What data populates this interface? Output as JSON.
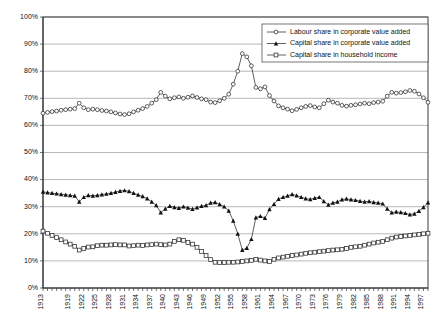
{
  "chart_data": {
    "type": "line",
    "title": "",
    "xlabel": "",
    "ylabel": "",
    "ylim": [
      0,
      100
    ],
    "xlim": [
      1913,
      1998
    ],
    "grid": true,
    "legend_position": "top-right",
    "y_ticks": [
      "0%",
      "10%",
      "20%",
      "30%",
      "40%",
      "50%",
      "60%",
      "70%",
      "80%",
      "90%",
      "100%"
    ],
    "y_tick_values": [
      0,
      10,
      20,
      30,
      40,
      50,
      60,
      70,
      80,
      90,
      100
    ],
    "x_tick_labels": [
      "1913",
      "1919",
      "1922",
      "1925",
      "1928",
      "1931",
      "1934",
      "1937",
      "1940",
      "1943",
      "1946",
      "1949",
      "1952",
      "1955",
      "1958",
      "1961",
      "1964",
      "1967",
      "1970",
      "1973",
      "1976",
      "1979",
      "1982",
      "1985",
      "1988",
      "1991",
      "1994",
      "1997"
    ],
    "x": [
      1913,
      1914,
      1915,
      1916,
      1917,
      1918,
      1919,
      1920,
      1921,
      1922,
      1923,
      1924,
      1925,
      1926,
      1927,
      1928,
      1929,
      1930,
      1931,
      1932,
      1933,
      1934,
      1935,
      1936,
      1937,
      1938,
      1939,
      1940,
      1941,
      1942,
      1943,
      1944,
      1945,
      1946,
      1947,
      1948,
      1949,
      1950,
      1951,
      1952,
      1953,
      1954,
      1955,
      1956,
      1957,
      1958,
      1959,
      1960,
      1961,
      1962,
      1963,
      1964,
      1965,
      1966,
      1967,
      1968,
      1969,
      1970,
      1971,
      1972,
      1973,
      1974,
      1975,
      1976,
      1977,
      1978,
      1979,
      1980,
      1981,
      1982,
      1983,
      1984,
      1985,
      1986,
      1987,
      1988,
      1989,
      1990,
      1991,
      1992,
      1993,
      1994,
      1995,
      1996,
      1997,
      1998
    ],
    "series": [
      {
        "name": "Labour share in corporate value added",
        "marker": "open-circle",
        "values": [
          64.5,
          64.8,
          65.1,
          65.3,
          65.6,
          65.8,
          66.0,
          66.2,
          68.2,
          66.5,
          65.8,
          66.0,
          65.8,
          65.5,
          65.3,
          65.0,
          64.6,
          64.2,
          64.0,
          64.3,
          65.0,
          65.6,
          66.2,
          67.0,
          68.2,
          69.5,
          72.2,
          70.8,
          69.8,
          70.2,
          70.5,
          70.0,
          70.4,
          70.9,
          70.3,
          69.8,
          69.5,
          68.6,
          68.4,
          69.1,
          70.0,
          71.5,
          75.2,
          80.0,
          86.5,
          85.3,
          82.0,
          74.0,
          73.5,
          74.2,
          71.0,
          69.0,
          67.2,
          66.5,
          66.0,
          65.4,
          65.9,
          66.5,
          67.0,
          67.3,
          66.8,
          66.5,
          68.0,
          69.3,
          68.6,
          68.2,
          67.4,
          67.1,
          67.4,
          67.6,
          67.9,
          68.2,
          68.0,
          68.4,
          68.6,
          68.9,
          70.8,
          72.2,
          71.9,
          72.1,
          72.4,
          72.9,
          72.6,
          71.6,
          70.2,
          68.5
        ]
      },
      {
        "name": "Capital share in corporate value added",
        "marker": "filled-triangle",
        "values": [
          35.5,
          35.2,
          35.0,
          34.8,
          34.6,
          34.4,
          34.2,
          34.0,
          31.8,
          33.5,
          34.2,
          34.0,
          34.2,
          34.5,
          34.7,
          35.0,
          35.4,
          35.8,
          36.0,
          35.7,
          35.0,
          34.4,
          33.8,
          33.0,
          31.8,
          30.5,
          27.8,
          29.2,
          30.2,
          29.8,
          29.5,
          30.0,
          29.6,
          29.1,
          29.7,
          30.2,
          30.5,
          31.4,
          31.6,
          30.9,
          30.0,
          28.5,
          24.8,
          20.0,
          14.0,
          14.7,
          18.0,
          26.0,
          26.5,
          25.8,
          29.0,
          31.0,
          32.8,
          33.5,
          34.0,
          34.6,
          34.1,
          33.5,
          33.0,
          32.7,
          33.2,
          33.5,
          32.0,
          30.7,
          31.4,
          31.8,
          32.6,
          32.9,
          32.6,
          32.4,
          32.1,
          31.8,
          32.0,
          31.6,
          31.4,
          31.1,
          29.2,
          27.8,
          28.1,
          27.9,
          27.6,
          27.1,
          27.4,
          28.4,
          29.8,
          31.5
        ]
      },
      {
        "name": "Capital share in household income",
        "marker": "open-square",
        "values": [
          21.0,
          20.2,
          19.4,
          18.6,
          17.8,
          17.0,
          16.2,
          15.4,
          14.0,
          14.6,
          15.1,
          15.2,
          15.6,
          15.8,
          15.8,
          15.9,
          16.0,
          15.9,
          15.9,
          15.5,
          15.6,
          15.8,
          15.7,
          15.9,
          16.0,
          16.2,
          16.0,
          15.9,
          16.2,
          17.2,
          17.8,
          17.6,
          16.8,
          16.2,
          15.0,
          13.5,
          12.0,
          10.5,
          9.5,
          9.4,
          9.4,
          9.5,
          9.5,
          9.6,
          9.8,
          10.0,
          10.2,
          10.6,
          10.3,
          10.0,
          9.8,
          10.6,
          11.1,
          11.4,
          11.7,
          12.0,
          12.2,
          12.5,
          12.8,
          13.0,
          13.2,
          13.4,
          13.6,
          13.8,
          14.0,
          14.1,
          14.3,
          14.6,
          15.0,
          15.2,
          15.4,
          15.8,
          16.2,
          16.6,
          16.9,
          17.2,
          17.8,
          18.4,
          18.8,
          19.0,
          19.2,
          19.4,
          19.6,
          19.8,
          20.0,
          20.2
        ]
      }
    ]
  },
  "legend": {
    "items": [
      "Labour share in corporate value added",
      "Capital share in corporate value added",
      "Capital share in household income"
    ]
  }
}
